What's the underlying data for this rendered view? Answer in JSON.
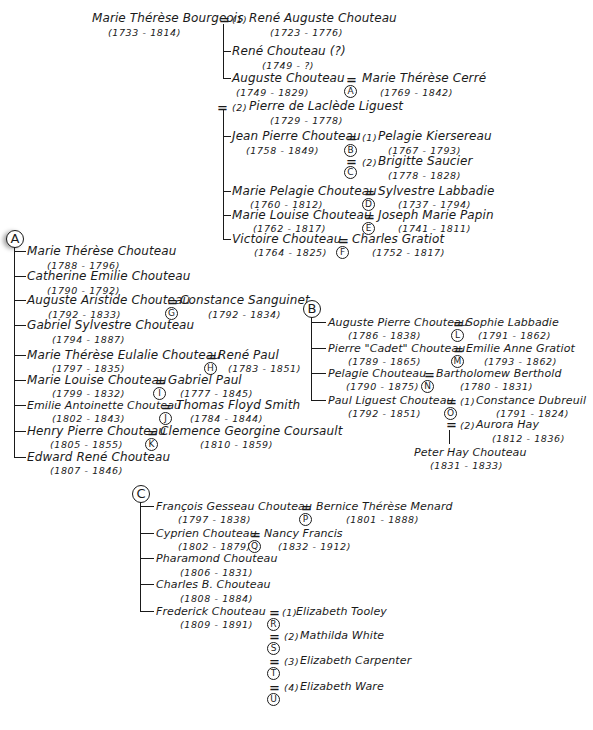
{
  "diagram": {
    "type": "genealogy-tree",
    "root": {
      "name": "Marie Thérèse Bourgeois",
      "dates": "(1733 - 1814)",
      "spouse1": {
        "marker": "(1)",
        "name": "René Auguste Chouteau",
        "dates": "(1723 - 1776)"
      },
      "spouse1_children": [
        {
          "name": "René Chouteau (?)",
          "dates": "(1749 - ?)"
        },
        {
          "name": "Auguste Chouteau",
          "dates": "(1749 - 1829)",
          "spouse": "Marie Thérèse Cerré",
          "spouse_dates": "(1769 - 1842)",
          "family_key": "A"
        }
      ],
      "spouse2": {
        "marker": "(2)",
        "name": "Pierre de Laclède Liguest",
        "dates": "(1729 - 1778)"
      },
      "spouse2_children": [
        {
          "name": "Jean Pierre Chouteau",
          "dates": "(1758 - 1849)",
          "spouses": [
            {
              "marker": "(1)",
              "name": "Pelagie Kiersereau",
              "dates": "(1767 - 1793)",
              "family_key": "B"
            },
            {
              "marker": "(2)",
              "name": "Brigitte Saucier",
              "dates": "(1778 - 1828)",
              "family_key": "C"
            }
          ]
        },
        {
          "name": "Marie Pelagie Chouteau",
          "dates": "(1760 - 1812)",
          "spouse": "Sylvestre Labbadie",
          "spouse_dates": "(1737 - 1794)",
          "family_key": "D"
        },
        {
          "name": "Marie Louise Chouteau",
          "dates": "(1762 - 1817)",
          "spouse": "Joseph Marie Papin",
          "spouse_dates": "(1741 - 1811)",
          "family_key": "E"
        },
        {
          "name": "Victoire Chouteau",
          "dates": "(1764 - 1825)",
          "spouse": "Charles Gratiot",
          "spouse_dates": "(1752 - 1817)",
          "family_key": "F"
        }
      ]
    },
    "family_A": {
      "key": "A",
      "children": [
        {
          "name": "Marie Thérèse Chouteau",
          "dates": "(1788 - 1796)"
        },
        {
          "name": "Catherine Emilie Chouteau",
          "dates": "(1790 - 1792)"
        },
        {
          "name": "Auguste Aristide Chouteau",
          "dates": "(1792 - 1833)",
          "spouse": "Constance Sanguinet",
          "spouse_dates": "(1792 - 1834)",
          "family_key": "G"
        },
        {
          "name": "Gabriel Sylvestre Chouteau",
          "dates": "(1794 - 1887)"
        },
        {
          "name": "Marie Thérèse Eulalie Chouteau",
          "dates": "(1797 - 1835)",
          "spouse": "René Paul",
          "spouse_dates": "(1783 - 1851)",
          "family_key": "H"
        },
        {
          "name": "Marie Louise Chouteau",
          "dates": "(1799 - 1832)",
          "spouse": "Gabriel Paul",
          "spouse_dates": "(1777 - 1845)",
          "family_key": "I"
        },
        {
          "name": "Emilie Antoinette Chouteau",
          "dates": "(1802 - 1843)",
          "spouse": "Thomas Floyd Smith",
          "spouse_dates": "(1784 - 1844)",
          "family_key": "J"
        },
        {
          "name": "Henry Pierre Chouteau",
          "dates": "(1805 - 1855)",
          "spouse": "Clemence Georgine Coursault",
          "spouse_dates": "(1810 - 1859)",
          "family_key": "K"
        },
        {
          "name": "Edward René Chouteau",
          "dates": "(1807 - 1846)"
        }
      ]
    },
    "family_B": {
      "key": "B",
      "children": [
        {
          "name": "Auguste Pierre Chouteau",
          "dates": "(1786 - 1838)",
          "spouse": "Sophie Labbadie",
          "spouse_dates": "(1791 - 1862)",
          "family_key": "L"
        },
        {
          "name": "Pierre \"Cadet\" Chouteau",
          "dates": "(1789 - 1865)",
          "spouse": "Emilie Anne Gratiot",
          "spouse_dates": "(1793 - 1862)",
          "family_key": "M"
        },
        {
          "name": "Pelagie Chouteau",
          "dates": "(1790 - 1875)",
          "spouse": "Bartholomew Berthold",
          "spouse_dates": "(1780 - 1831)",
          "family_key": "N"
        },
        {
          "name": "Paul Liguest Chouteau",
          "dates": "(1792 - 1851)",
          "spouses": [
            {
              "marker": "(1)",
              "name": "Constance Dubreuil",
              "dates": "(1791 - 1824)",
              "family_key": "O"
            },
            {
              "marker": "(2)",
              "name": "Aurora Hay",
              "dates": "(1812 - 1836)"
            }
          ],
          "child": {
            "name": "Peter Hay Chouteau",
            "dates": "(1831 - 1833)"
          }
        }
      ]
    },
    "family_C": {
      "key": "C",
      "children": [
        {
          "name": "François Gesseau Chouteau",
          "dates": "(1797 - 1838)",
          "spouse": "Bernice Thérèse Menard",
          "spouse_dates": "(1801 - 1888)",
          "family_key": "P"
        },
        {
          "name": "Cyprien Chouteau",
          "dates": "(1802 - 1879)",
          "spouse": "Nancy Francis",
          "spouse_dates": "(1832 - 1912)",
          "family_key": "Q"
        },
        {
          "name": "Pharamond Chouteau",
          "dates": "(1806 - 1831)"
        },
        {
          "name": "Charles B. Chouteau",
          "dates": "(1808 - 1884)"
        },
        {
          "name": "Frederick Chouteau",
          "dates": "(1809 - 1891)",
          "spouses": [
            {
              "marker": "(1)",
              "name": "Elizabeth Tooley",
              "family_key": "R"
            },
            {
              "marker": "(2)",
              "name": "Mathilda White",
              "family_key": "S"
            },
            {
              "marker": "(3)",
              "name": "Elizabeth Carpenter",
              "family_key": "T"
            },
            {
              "marker": "(4)",
              "name": "Elizabeth Ware",
              "family_key": "U"
            }
          ]
        }
      ]
    },
    "symbols": {
      "marriage": "=",
      "ink_color": "#1a1a1a",
      "background": "#ffffff"
    }
  }
}
